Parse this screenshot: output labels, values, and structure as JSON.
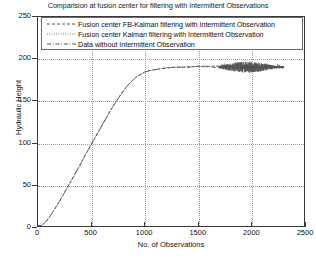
{
  "chart_data": {
    "type": "line",
    "title": "Comparision at fusion center for filtering with Intermittent Observations",
    "xlabel": "No. of Observations",
    "ylabel": "Hydraulic Height",
    "xlim": [
      0,
      2500
    ],
    "ylim": [
      0,
      250
    ],
    "xticks": [
      "0",
      "500",
      "1000",
      "1500",
      "2000",
      "2500"
    ],
    "xtick_values": [
      0,
      500,
      1000,
      1500,
      2000,
      2500
    ],
    "yticks": [
      "0",
      "50",
      "100",
      "150",
      "200",
      "250"
    ],
    "ytick_values": [
      0,
      50,
      100,
      150,
      200,
      250
    ],
    "grid": true,
    "legend_position": "top-center-inside",
    "legend": [
      {
        "label": "Fusion center FB-Kalman filtering with Intermittent Observation",
        "style": "dashed",
        "color": "#404040"
      },
      {
        "label": "Fusion center Kalman filtering with Intermittent Observation",
        "style": "dotted",
        "color": "#404040"
      },
      {
        "label": "Data without Intermittent Observation",
        "style": "dashdot",
        "color": "#404040"
      }
    ],
    "series": [
      {
        "name": "Fusion center FB-Kalman filtering with Intermittent Observation",
        "style": "dashed",
        "color": "#3c3c3c",
        "x": [
          0,
          40,
          80,
          120,
          160,
          200,
          240,
          280,
          320,
          360,
          400,
          440,
          480,
          520,
          560,
          600,
          640,
          680,
          720,
          760,
          800,
          840,
          880,
          920,
          960,
          1000,
          1050,
          1100,
          1200,
          1300,
          1400,
          1500,
          1600,
          1700,
          1750,
          1800,
          1850,
          1900,
          1950,
          2000,
          2050,
          2100,
          2150,
          2200,
          2250,
          2300
        ],
        "y": [
          0,
          1,
          6,
          13,
          21,
          29,
          38,
          47,
          56,
          65,
          74,
          84,
          93,
          102,
          111,
          120,
          129,
          138,
          146,
          154,
          161,
          168,
          173,
          178,
          181,
          184,
          186,
          187,
          189,
          190,
          190,
          191,
          191,
          191,
          190,
          192,
          189,
          193,
          188,
          192,
          189,
          193,
          190,
          191,
          190,
          191
        ]
      },
      {
        "name": "Fusion center Kalman filtering with Intermittent Observation",
        "style": "dotted",
        "color": "#4a4a4a",
        "x": [
          0,
          40,
          80,
          120,
          160,
          200,
          240,
          280,
          320,
          360,
          400,
          440,
          480,
          520,
          560,
          600,
          640,
          680,
          720,
          760,
          800,
          840,
          880,
          920,
          960,
          1000,
          1050,
          1100,
          1200,
          1300,
          1400,
          1500,
          1600,
          1700,
          1750,
          1800,
          1850,
          1900,
          1950,
          2000,
          2050,
          2100,
          2150,
          2200,
          2250,
          2300
        ],
        "y": [
          0,
          1,
          6,
          13,
          21,
          29,
          38,
          47,
          56,
          65,
          74,
          84,
          93,
          102,
          111,
          120,
          129,
          138,
          146,
          154,
          161,
          168,
          173,
          178,
          181,
          184,
          186,
          187,
          189,
          190,
          190,
          191,
          190,
          192,
          193,
          187,
          194,
          186,
          193,
          187,
          194,
          188,
          192,
          189,
          192,
          190
        ]
      },
      {
        "name": "Data without Intermittent Observation",
        "style": "dashdot",
        "color": "#555555",
        "x": [
          0,
          40,
          80,
          120,
          160,
          200,
          240,
          280,
          320,
          360,
          400,
          440,
          480,
          520,
          560,
          600,
          640,
          680,
          720,
          760,
          800,
          840,
          880,
          920,
          960,
          1000,
          1050,
          1100,
          1200,
          1300,
          1400,
          1500,
          1600,
          1700,
          1750,
          1800,
          1850,
          1900,
          1950,
          2000,
          2050,
          2100,
          2150,
          2200,
          2250,
          2300
        ],
        "y": [
          0,
          1,
          6,
          13,
          21,
          29,
          38,
          47,
          56,
          65,
          74,
          84,
          93,
          102,
          111,
          120,
          129,
          138,
          146,
          154,
          161,
          168,
          173,
          178,
          181,
          184,
          186,
          187,
          189,
          190,
          190,
          191,
          191,
          189,
          195,
          190,
          185,
          194,
          191,
          186,
          193,
          190,
          194,
          188,
          193,
          190
        ]
      }
    ],
    "noise_region": {
      "x_start": 1700,
      "x_end": 2310,
      "center": 190,
      "amplitude": 6,
      "description": "dense overlapping noisy scatter around plateau"
    }
  }
}
